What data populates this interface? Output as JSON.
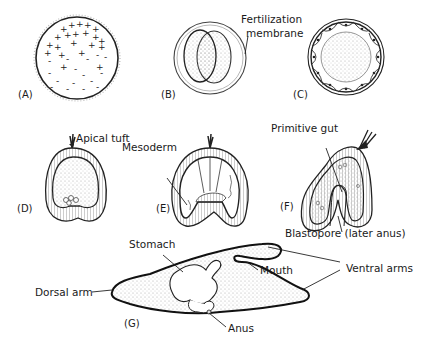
{
  "figure": {
    "panels": [
      {
        "id": "A",
        "tag": "(A)",
        "description": "Egg with + and - charges"
      },
      {
        "id": "B",
        "tag": "(B)",
        "description": "Two-cell stage within fertilization membrane"
      },
      {
        "id": "C",
        "tag": "(C)",
        "description": "Blastula"
      },
      {
        "id": "D",
        "tag": "(D)",
        "description": "Early gastrula with apical tuft"
      },
      {
        "id": "E",
        "tag": "(E)",
        "description": "Gastrula with mesoderm"
      },
      {
        "id": "F",
        "tag": "(F)",
        "description": "Primitive gut and blastopore"
      },
      {
        "id": "G",
        "tag": "(G)",
        "description": "Pluteus larva"
      }
    ],
    "labels": {
      "fertilization_membrane_1": "Fertilization",
      "fertilization_membrane_2": "membrane",
      "apical_tuft": "Apical tuft",
      "mesoderm": "Mesoderm",
      "primitive_gut": "Primitive gut",
      "blastopore": "Blastopore (later anus)",
      "stomach": "Stomach",
      "mouth": "Mouth",
      "ventral_arms": "Ventral arms",
      "dorsal_arm": "Dorsal arm",
      "anus": "Anus"
    },
    "colors": {
      "ink": "#1a1a1a",
      "stipple": "#9a9a9a",
      "background": "#ffffff"
    }
  }
}
